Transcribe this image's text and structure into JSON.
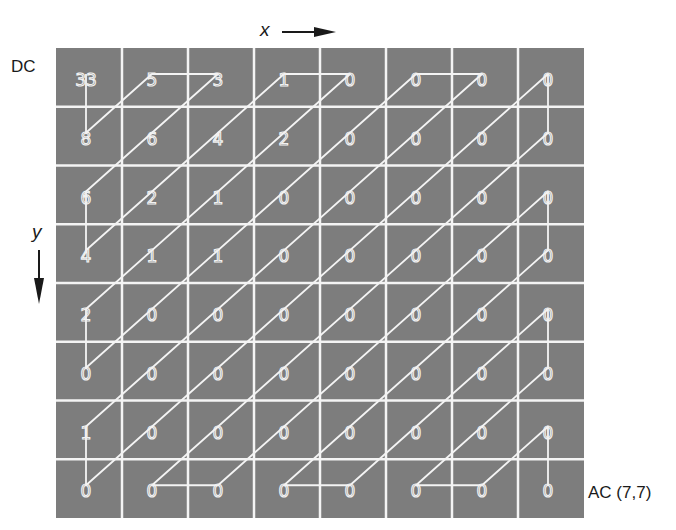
{
  "labels": {
    "x_axis": "x",
    "y_axis": "y",
    "dc": "DC",
    "ac_end": "AC (7,7)"
  },
  "colors": {
    "cell_fill": "#7d7d7d",
    "grid_line": "#f4f4f4",
    "path_line": "#f4f4f4",
    "text": "#1a1a1a",
    "arrow": "#1a1a1a"
  },
  "grid": {
    "rows": 8,
    "cols": 8,
    "values": [
      [
        33,
        5,
        3,
        1,
        0,
        0,
        0,
        0
      ],
      [
        8,
        6,
        4,
        2,
        0,
        0,
        0,
        0
      ],
      [
        6,
        2,
        1,
        0,
        0,
        0,
        0,
        0
      ],
      [
        4,
        1,
        1,
        0,
        0,
        0,
        0,
        0
      ],
      [
        2,
        0,
        0,
        0,
        0,
        0,
        0,
        0
      ],
      [
        0,
        0,
        0,
        0,
        0,
        0,
        0,
        0
      ],
      [
        1,
        0,
        0,
        0,
        0,
        0,
        0,
        0
      ],
      [
        0,
        0,
        0,
        0,
        0,
        0,
        0,
        0
      ]
    ]
  },
  "zigzag_path": [
    [
      0,
      0
    ],
    [
      0,
      1
    ],
    [
      1,
      0
    ],
    [
      2,
      0
    ],
    [
      0,
      2
    ],
    [
      0,
      3
    ],
    [
      3,
      0
    ],
    [
      4,
      0
    ],
    [
      0,
      4
    ],
    [
      0,
      5
    ],
    [
      5,
      0
    ],
    [
      6,
      0
    ],
    [
      0,
      6
    ],
    [
      0,
      7
    ],
    [
      7,
      0
    ],
    [
      7,
      1
    ],
    [
      1,
      7
    ],
    [
      2,
      7
    ],
    [
      7,
      2
    ],
    [
      7,
      3
    ],
    [
      3,
      7
    ],
    [
      4,
      7
    ],
    [
      7,
      4
    ],
    [
      7,
      5
    ],
    [
      5,
      7
    ],
    [
      6,
      7
    ],
    [
      7,
      6
    ],
    [
      7,
      7
    ]
  ]
}
